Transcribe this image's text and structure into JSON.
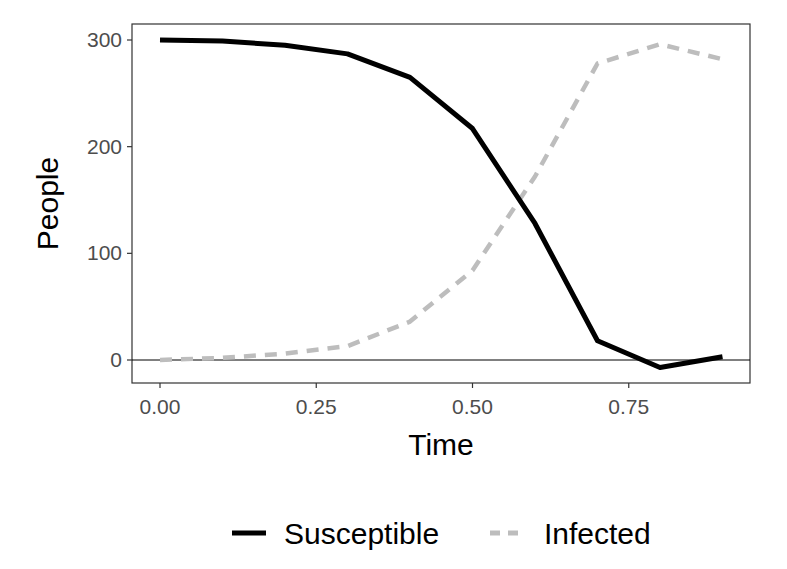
{
  "chart_data": {
    "type": "line",
    "title": "",
    "xlabel": "Time",
    "ylabel": "People",
    "xlim": [
      -0.045,
      0.945
    ],
    "ylim": [
      -21,
      315
    ],
    "x_ticks": [
      0.0,
      0.25,
      0.5,
      0.75
    ],
    "x_tick_labels": [
      "0.00",
      "0.25",
      "0.50",
      "0.75"
    ],
    "y_ticks": [
      0,
      100,
      200,
      300
    ],
    "y_tick_labels": [
      "0",
      "100",
      "200",
      "300"
    ],
    "grid": false,
    "hline": 0,
    "legend_position": "bottom",
    "x": [
      0.0,
      0.1,
      0.2,
      0.3,
      0.4,
      0.5,
      0.6,
      0.7,
      0.8,
      0.9
    ],
    "series": [
      {
        "name": "Susceptible",
        "style": "solid",
        "color": "#000000",
        "values": [
          300,
          299,
          295,
          287,
          265,
          217,
          128,
          18,
          -7,
          3
        ]
      },
      {
        "name": "Infected",
        "style": "dashed",
        "color": "#bdbdbd",
        "values": [
          0,
          2,
          6,
          13,
          36,
          84,
          172,
          278,
          296,
          282
        ]
      }
    ]
  }
}
